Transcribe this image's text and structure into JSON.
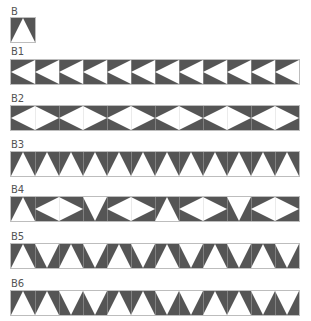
{
  "colors": {
    "dark": "#555555",
    "light": "#ffffff",
    "seam": "#c8c8c8"
  },
  "blocks": [
    {
      "label": "B",
      "top": 18,
      "label_top": 6,
      "pattern": [
        "up"
      ]
    },
    {
      "label": "B1",
      "top": 60,
      "label_top": 46,
      "pattern": [
        "left",
        "left",
        "left",
        "left",
        "left",
        "left",
        "left",
        "left",
        "left",
        "left",
        "left",
        "left"
      ]
    },
    {
      "label": "B2",
      "top": 106,
      "label_top": 93,
      "pattern": [
        "left",
        "right",
        "left",
        "right",
        "left",
        "right",
        "left",
        "right",
        "left",
        "right",
        "left",
        "right"
      ]
    },
    {
      "label": "B3",
      "top": 152,
      "label_top": 139,
      "pattern": [
        "up",
        "up",
        "up",
        "up",
        "up",
        "up",
        "up",
        "up",
        "up",
        "up",
        "up",
        "up"
      ]
    },
    {
      "label": "B4",
      "top": 197,
      "label_top": 184,
      "pattern": [
        "up",
        "left",
        "right",
        "down",
        "left",
        "right",
        "up",
        "left",
        "right",
        "down",
        "left",
        "right"
      ]
    },
    {
      "label": "B5",
      "top": 244,
      "label_top": 231,
      "pattern": [
        "up",
        "down",
        "up",
        "down",
        "up",
        "down",
        "up",
        "down",
        "up",
        "down",
        "up",
        "down"
      ]
    },
    {
      "label": "B6",
      "top": 291,
      "label_top": 278,
      "pattern": [
        "up",
        "up",
        "down",
        "down",
        "up",
        "up",
        "down",
        "down",
        "up",
        "up",
        "down",
        "down"
      ]
    }
  ]
}
